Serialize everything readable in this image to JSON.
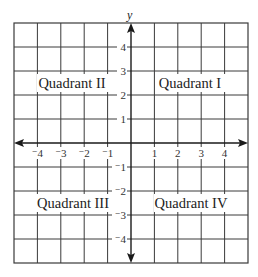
{
  "diagram": {
    "type": "coordinate-plane",
    "axis_labels": {
      "y": "y"
    },
    "x_ticks": [
      "-4",
      "-3",
      "-2",
      "-1",
      "1",
      "2",
      "3",
      "4"
    ],
    "y_ticks": [
      "4",
      "3",
      "2",
      "1",
      "-1",
      "-2",
      "-3",
      "-4"
    ],
    "x_ticks_display": [
      "⁻4",
      "⁻3",
      "⁻2",
      "⁻1",
      "1",
      "2",
      "3",
      "4"
    ],
    "y_ticks_display": [
      "4",
      "3",
      "2",
      "1",
      "⁻1",
      "⁻2",
      "⁻3",
      "⁻4"
    ],
    "quadrants": [
      {
        "id": "I",
        "label": "Quadrant I"
      },
      {
        "id": "II",
        "label": "Quadrant II"
      },
      {
        "id": "III",
        "label": "Quadrant III"
      },
      {
        "id": "IV",
        "label": "Quadrant IV"
      }
    ],
    "grid": {
      "range": [
        -5,
        5
      ],
      "cells_per_side": 10
    },
    "colors": {
      "line": "#3a3a3a",
      "axis": "#1a1a1a",
      "background": "#ffffff"
    }
  }
}
